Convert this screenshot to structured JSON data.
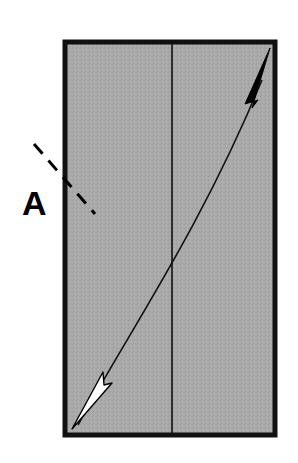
{
  "diagram": {
    "label": "A",
    "colors": {
      "panel_fill": "#a8a8a8",
      "border": "#111111",
      "line": "#111111",
      "arrow_up": "#000000",
      "arrow_down": "#ffffff"
    },
    "elements": {
      "panel": "rectangle",
      "center_line": "vertical-fold-line",
      "curve": "double-headed-curved-arrow",
      "arrow_top": "filled-black-arrowhead",
      "arrow_bottom": "white-outlined-arrowhead",
      "dashed_line": "diagonal-dashed-cut-line"
    }
  }
}
